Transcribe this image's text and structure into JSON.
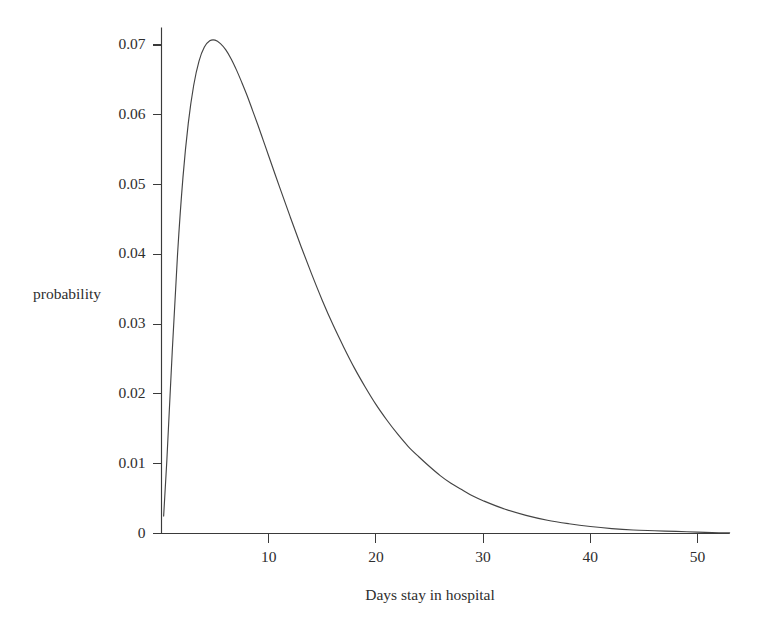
{
  "chart_data": {
    "type": "line",
    "title": "",
    "subtitle": "",
    "xlabel": "Days stay in hospital",
    "ylabel": "probability",
    "xlim": [
      0,
      53
    ],
    "ylim": [
      0,
      0.0725
    ],
    "grid": false,
    "legend": null,
    "x_ticks": [
      10,
      20,
      30,
      40,
      50
    ],
    "x_tick_labels": [
      "10",
      "20",
      "30",
      "40",
      "50"
    ],
    "y_ticks": [
      0,
      0.01,
      0.02,
      0.03,
      0.04,
      0.05,
      0.06,
      0.07
    ],
    "y_tick_labels": [
      "0",
      "0.01",
      "0.02",
      "0.03",
      "0.04",
      "0.05",
      "0.06",
      "0.07"
    ],
    "series": [
      {
        "name": "probability density of days stay in hospital",
        "color": "#444444",
        "peak_x": 6.0,
        "peak_y": 0.0705,
        "x": [
          0.2,
          0.5,
          1.0,
          1.5,
          2.0,
          2.5,
          3.0,
          3.5,
          4.0,
          4.5,
          5.0,
          5.5,
          6.0,
          6.5,
          7.0,
          7.5,
          8.0,
          8.5,
          9.0,
          9.5,
          10.0,
          11.0,
          12.0,
          13.0,
          14.0,
          15.0,
          16.0,
          17.0,
          18.0,
          19.0,
          20.0,
          21.0,
          22.0,
          23.0,
          24.0,
          25.0,
          26.0,
          27.0,
          28.0,
          29.0,
          30.0,
          32.0,
          34.0,
          36.0,
          38.0,
          40.0,
          42.0,
          44.0,
          46.0,
          48.0,
          50.0,
          52.0,
          53.0
        ],
        "y": [
          0.0025,
          0.0105,
          0.026,
          0.0401,
          0.051,
          0.0588,
          0.0642,
          0.0677,
          0.0697,
          0.0706,
          0.0707,
          0.0702,
          0.0693,
          0.068,
          0.0664,
          0.0646,
          0.0627,
          0.0606,
          0.0585,
          0.0563,
          0.0541,
          0.0497,
          0.0454,
          0.0412,
          0.0372,
          0.0334,
          0.0299,
          0.0267,
          0.0237,
          0.021,
          0.0185,
          0.0163,
          0.0143,
          0.0125,
          0.011,
          0.0096,
          0.0083,
          0.0072,
          0.0063,
          0.0054,
          0.0047,
          0.0035,
          0.0026,
          0.0019,
          0.0014,
          0.001,
          0.0007,
          0.0005,
          0.0004,
          0.0003,
          0.0002,
          0.0001,
          0.0001
        ]
      }
    ]
  },
  "axes": {
    "y_axis_name": "probability-axis",
    "x_axis_name": "days-axis"
  }
}
